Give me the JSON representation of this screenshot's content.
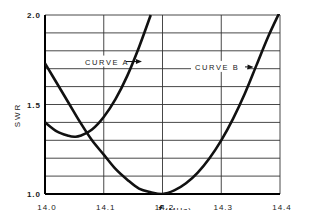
{
  "chart_data": {
    "type": "line",
    "title": "",
    "xlabel": "f (MHz)",
    "ylabel": "SWR",
    "xlim": [
      14.0,
      14.4
    ],
    "ylim": [
      1.0,
      2.0
    ],
    "grid": true,
    "x_ticks": [
      "14.0",
      "14.1",
      "14.2",
      "14.3",
      "14.4"
    ],
    "y_ticks": [
      "1.0",
      "1.5",
      "2.0"
    ],
    "series": [
      {
        "name": "CURVE A",
        "x": [
          14.0,
          14.02,
          14.04,
          14.05,
          14.06,
          14.08,
          14.1,
          14.12,
          14.14,
          14.16,
          14.18
        ],
        "values": [
          1.4,
          1.35,
          1.325,
          1.32,
          1.325,
          1.36,
          1.43,
          1.53,
          1.66,
          1.82,
          2.0
        ]
      },
      {
        "name": "CURVE B",
        "x": [
          14.0,
          14.02,
          14.04,
          14.06,
          14.08,
          14.1,
          14.12,
          14.14,
          14.16,
          14.18,
          14.2,
          14.22,
          14.24,
          14.26,
          14.28,
          14.3,
          14.32,
          14.34,
          14.36,
          14.38,
          14.4
        ],
        "values": [
          1.73,
          1.62,
          1.51,
          1.4,
          1.3,
          1.22,
          1.14,
          1.08,
          1.03,
          1.01,
          1.0,
          1.02,
          1.06,
          1.12,
          1.2,
          1.3,
          1.42,
          1.56,
          1.72,
          1.88,
          2.02
        ]
      }
    ],
    "annotations": [
      {
        "text": "CURVE A",
        "points_to": "CURVE A",
        "x": 14.165,
        "y": 1.74
      },
      {
        "text": "CURVE B",
        "points_to": "CURVE B",
        "x": 14.355,
        "y": 1.71
      }
    ],
    "colors": {
      "line": "#111111",
      "grid": "#333333",
      "background": "#ffffff"
    }
  }
}
